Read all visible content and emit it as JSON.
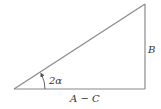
{
  "diagram": {
    "type": "right-triangle",
    "stroke_color": "#8a8a8a",
    "text_color": "#333333",
    "labels": {
      "vertical_side": "B",
      "base_side": "A − C",
      "angle": "2α"
    },
    "vertices": {
      "bottom_left": [
        14,
        89
      ],
      "bottom_right": [
        145,
        89
      ],
      "top_right": [
        145,
        4
      ]
    }
  }
}
